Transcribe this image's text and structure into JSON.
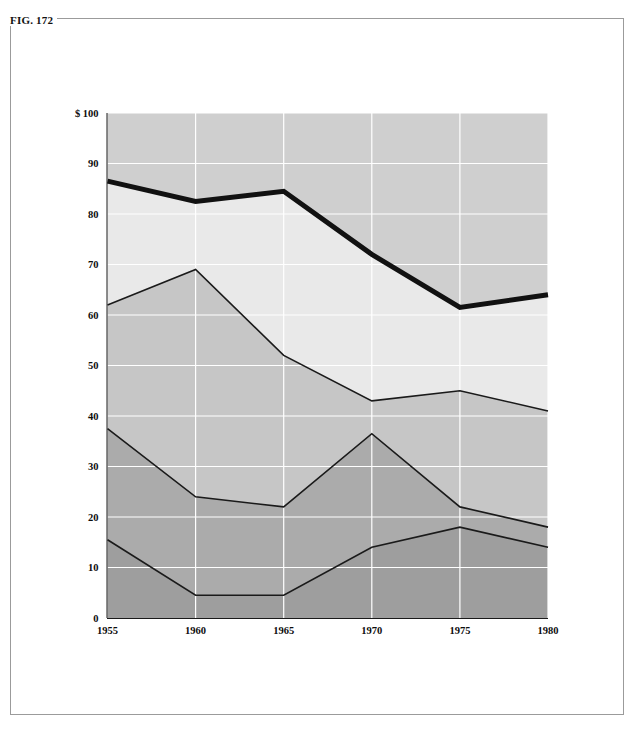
{
  "figure": {
    "label": "FIG. 172"
  },
  "chart_data": {
    "type": "area",
    "title": "",
    "subtitle": "",
    "xlabel": "",
    "ylabel": "",
    "x": [
      1955,
      1960,
      1965,
      1970,
      1975,
      1980
    ],
    "xtick_labels": [
      "1955",
      "1960",
      "1965",
      "1970",
      "1975",
      "1980"
    ],
    "ytick_labels": [
      "0",
      "10",
      "20",
      "30",
      "40",
      "50",
      "60",
      "70",
      "80",
      "90",
      "$ 100"
    ],
    "ytick_values": [
      0,
      10,
      20,
      30,
      40,
      50,
      60,
      70,
      80,
      90,
      100
    ],
    "ylim": [
      0,
      100
    ],
    "xlim": [
      1955,
      1980
    ],
    "grid": true,
    "grid_color": "#ffffff",
    "legend": "none",
    "series": [
      {
        "name": "series-1-top-bold",
        "values": [
          86.5,
          82.5,
          84.5,
          72.0,
          61.5,
          64.0
        ],
        "line_color": "#111111",
        "line_width": 5,
        "band_fill_above": "#cfcfcf"
      },
      {
        "name": "series-2",
        "values": [
          62.0,
          69.0,
          52.0,
          43.0,
          45.0,
          41.0
        ],
        "line_color": "#1a1a1a",
        "line_width": 1.6,
        "band_fill_above": "#e9e9e9"
      },
      {
        "name": "series-3",
        "values": [
          37.5,
          24.0,
          22.0,
          36.5,
          22.0,
          18.0
        ],
        "line_color": "#1a1a1a",
        "line_width": 1.6,
        "band_fill_above": "#c6c6c6"
      },
      {
        "name": "series-4",
        "values": [
          15.5,
          4.5,
          4.5,
          14.0,
          18.0,
          14.0
        ],
        "line_color": "#1a1a1a",
        "line_width": 1.6,
        "band_fill_above": "#ababab"
      }
    ],
    "bottom_band_fill": "#9e9e9e"
  }
}
